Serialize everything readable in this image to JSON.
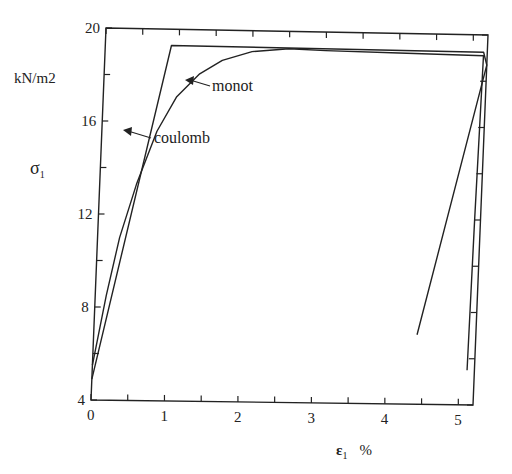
{
  "chart_data": {
    "type": "line",
    "title": "",
    "xlabel": "ε1 %",
    "ylabel": "σ1",
    "y_unit_label": "kN/m2",
    "xlim": [
      0,
      5.2
    ],
    "ylim": [
      4,
      20
    ],
    "xticks": [
      0,
      1,
      2,
      3,
      4,
      5
    ],
    "yticks": [
      4,
      8,
      12,
      16,
      20
    ],
    "x_minor_step": 0.5,
    "y_minor_step": 2,
    "grid": false,
    "legend": null,
    "series": [
      {
        "name": "coulomb",
        "x": [
          0.0,
          0.9,
          5.15,
          5.2,
          4.4
        ],
        "y": [
          4.9,
          19.3,
          19.25,
          18.7,
          7.0
        ]
      },
      {
        "name": "monot",
        "x": [
          0.0,
          0.15,
          0.3,
          0.5,
          0.75,
          1.0,
          1.3,
          1.6,
          2.0,
          2.5,
          3.0,
          4.0,
          5.15,
          5.12,
          5.1
        ],
        "y": [
          5.5,
          8.5,
          11.0,
          13.3,
          15.6,
          17.1,
          18.1,
          18.7,
          19.1,
          19.25,
          19.2,
          19.15,
          19.1,
          12.0,
          5.5
        ]
      }
    ],
    "annotations": [
      {
        "text": "monot",
        "arrow_to": [
          1.25,
          17.6
        ]
      },
      {
        "text": "coulomb",
        "arrow_to": [
          0.65,
          15.6
        ]
      }
    ]
  },
  "labels": {
    "y_unit": "kN/m2",
    "y_title": "σ",
    "y_title_sub": "1",
    "x_title": "ε",
    "x_title_sub": "1",
    "x_title_unit": "%",
    "monot": "monot",
    "coulomb": "coulomb",
    "yticks": [
      "4",
      "8",
      "12",
      "16",
      "20"
    ],
    "xticks": [
      "0",
      "1",
      "2",
      "3",
      "4",
      "5"
    ]
  }
}
